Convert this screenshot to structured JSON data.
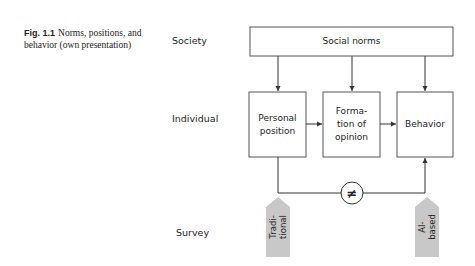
{
  "caption": {
    "label": "Fig. 1.1",
    "text": "Norms, positions, and behavior (own presentation)"
  },
  "rows": {
    "society": "Society",
    "individual": "Individual",
    "survey": "Survey"
  },
  "boxes": {
    "social_norms": "Social norms",
    "personal_position": "Personal position",
    "formation_of_opinion": "Forma-\ntion of\nopinion",
    "behavior": "Behavior"
  },
  "comparison_symbol": "≠",
  "surveys": {
    "traditional": "Tradi-\ntional",
    "ai_based": "AI-\nbased"
  },
  "colors": {
    "line": "#333333",
    "survey_fill": "#c8c8c8"
  }
}
